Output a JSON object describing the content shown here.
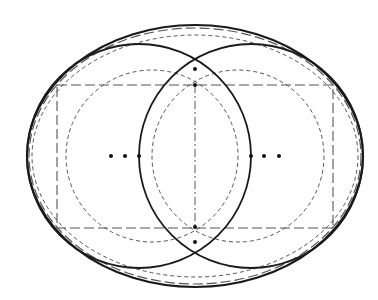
{
  "diagram": {
    "type": "geometric-construction",
    "canvas": {
      "width": 378,
      "height": 300,
      "background": "#ffffff"
    },
    "colors": {
      "solid": "#1a1a1a",
      "dashed": "#555555",
      "dot": "#111111"
    },
    "center": {
      "x": 195,
      "y": 156
    },
    "outer_ellipses": [
      {
        "cx": 195,
        "cy": 156,
        "rx": 168,
        "ry": 131,
        "style": "solid",
        "width": 2.2
      },
      {
        "cx": 195,
        "cy": 156,
        "rx": 166,
        "ry": 128,
        "style": "long-dash",
        "width": 1.2
      },
      {
        "cx": 195,
        "cy": 156,
        "rx": 163,
        "ry": 121,
        "style": "dashed",
        "width": 1.0
      }
    ],
    "solid_circles": [
      {
        "cx": 139,
        "cy": 156,
        "r": 112
      },
      {
        "cx": 251,
        "cy": 156,
        "r": 112
      }
    ],
    "dashed_circles": [
      {
        "cx": 152,
        "cy": 156,
        "r": 86
      },
      {
        "cx": 238,
        "cy": 156,
        "r": 86
      }
    ],
    "rectangle": {
      "x": 57,
      "y": 85,
      "width": 276,
      "height": 143,
      "style": "long-dash"
    },
    "vertical_axis": {
      "x": 195,
      "y1": 85,
      "y2": 228,
      "style": "dash-dot"
    },
    "dots": [
      {
        "x": 111,
        "y": 156
      },
      {
        "x": 125,
        "y": 156
      },
      {
        "x": 139,
        "y": 156
      },
      {
        "x": 251,
        "y": 156
      },
      {
        "x": 264,
        "y": 156
      },
      {
        "x": 279,
        "y": 156
      },
      {
        "x": 195,
        "y": 69
      },
      {
        "x": 195,
        "y": 85
      },
      {
        "x": 195,
        "y": 227
      },
      {
        "x": 195,
        "y": 242
      }
    ]
  }
}
